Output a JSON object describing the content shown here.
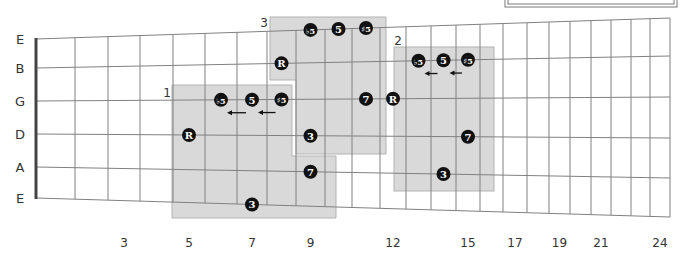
{
  "diagram": {
    "type": "guitar-fretboard",
    "strings": [
      "E",
      "B",
      "G",
      "D",
      "A",
      "E"
    ],
    "fret_numbers": [
      {
        "fret": 3,
        "label": "3"
      },
      {
        "fret": 5,
        "label": "5"
      },
      {
        "fret": 7,
        "label": "7"
      },
      {
        "fret": 9,
        "label": "9"
      },
      {
        "fret": 12,
        "label": "12"
      },
      {
        "fret": 15,
        "label": "15"
      },
      {
        "fret": 17,
        "label": "17"
      },
      {
        "fret": 19,
        "label": "19"
      },
      {
        "fret": 21,
        "label": "21"
      },
      {
        "fret": 24,
        "label": "24"
      }
    ],
    "positions": [
      {
        "label": "1"
      },
      {
        "label": "2"
      },
      {
        "label": "3"
      }
    ],
    "notes": [
      {
        "pos": "1",
        "string": "D",
        "fret": 5,
        "degree": "R"
      },
      {
        "pos": "1",
        "string": "G",
        "fret": 6,
        "degree": "♭5"
      },
      {
        "pos": "1",
        "string": "G",
        "fret": 7,
        "degree": "5"
      },
      {
        "pos": "1",
        "string": "G",
        "fret": 8,
        "degree": "♯5"
      },
      {
        "pos": "1",
        "string": "E",
        "fret": 7,
        "degree": "3"
      },
      {
        "pos": "1",
        "string": "A",
        "fret": 9,
        "degree": "7"
      },
      {
        "pos": "1",
        "string": "D",
        "fret": 9,
        "degree": "3"
      },
      {
        "pos": "3",
        "string": "B",
        "fret": 8,
        "degree": "R"
      },
      {
        "pos": "3",
        "string": "E",
        "fret": 9,
        "degree": "♭5"
      },
      {
        "pos": "3",
        "string": "E",
        "fret": 10,
        "degree": "5"
      },
      {
        "pos": "3",
        "string": "E",
        "fret": 11,
        "degree": "♯5"
      },
      {
        "pos": "3",
        "string": "G",
        "fret": 11,
        "degree": "7"
      },
      {
        "pos": "2",
        "string": "G",
        "fret": 12,
        "degree": "R"
      },
      {
        "pos": "2",
        "string": "B",
        "fret": 13,
        "degree": "♭5"
      },
      {
        "pos": "2",
        "string": "B",
        "fret": 14,
        "degree": "5"
      },
      {
        "pos": "2",
        "string": "B",
        "fret": 15,
        "degree": "♯5"
      },
      {
        "pos": "2",
        "string": "D",
        "fret": 15,
        "degree": "7"
      },
      {
        "pos": "2",
        "string": "A",
        "fret": 14,
        "degree": "3"
      }
    ],
    "arrows": [
      {
        "pos": "1",
        "from_fret": 7,
        "to_fret": 6,
        "string": "G"
      },
      {
        "pos": "1",
        "from_fret": 8,
        "to_fret": 7,
        "string": "G"
      },
      {
        "pos": "2",
        "from_fret": 14,
        "to_fret": 13,
        "string": "B"
      },
      {
        "pos": "2",
        "from_fret": 15,
        "to_fret": 14,
        "string": "B"
      }
    ],
    "colors": {
      "box_fill": "#d9d9d9",
      "box_stroke": "#b3b3b3",
      "grid": "#808080",
      "dot": "#111111",
      "nut": "#444444"
    }
  }
}
